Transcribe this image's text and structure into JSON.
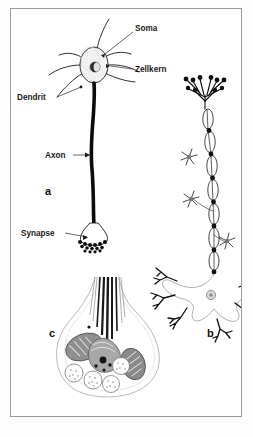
{
  "figure": {
    "panels": [
      {
        "id": "a",
        "label": "a",
        "description": "Schematic neuron with soma, dendrites, axon and synapse"
      },
      {
        "id": "b",
        "label": "b",
        "description": "Myelinated multipolar neuron with Schwann cells and nodes of Ranvier"
      },
      {
        "id": "c",
        "label": "c",
        "description": "Synaptic end bouton with mitochondria, vesicles and microtubules"
      }
    ],
    "labels": {
      "soma": "Soma",
      "zellkern": "Zellkern",
      "dendrit": "Dendrit",
      "axon": "Axon",
      "synapse": "Synapse"
    },
    "panel_labels": {
      "a": "a",
      "b": "b",
      "c": "c"
    },
    "colors": {
      "ink": "#111111",
      "frame": "#9a9a9a",
      "axon_fill": "#111111",
      "soma_fill": "#f0f0f0",
      "nucleus_fill": "#555555",
      "mitochondria_fill": "#8d8d8d",
      "vesicle_fill": "#ffffff",
      "background": "#ffffff"
    },
    "caption": ""
  }
}
